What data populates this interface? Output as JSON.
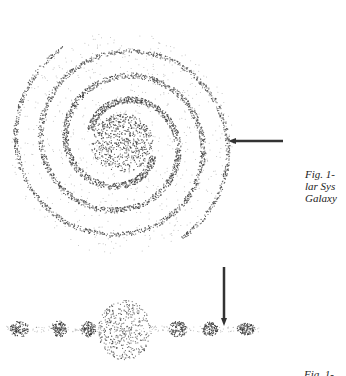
{
  "figure": {
    "top_view": {
      "name": "galaxy-top-view",
      "center": [
        122,
        143
      ],
      "arms": 2,
      "arrow": {
        "from": [
          283,
          141
        ],
        "to": [
          228,
          141
        ],
        "color": "#333333"
      }
    },
    "side_view": {
      "name": "galaxy-edge-on-view",
      "plane_y": 329,
      "bulge": {
        "cx": 125,
        "cy": 330,
        "rx": 27,
        "ry": 30
      },
      "clumps": [
        {
          "cx": 20,
          "rx": 10,
          "ry": 8
        },
        {
          "cx": 59,
          "rx": 8,
          "ry": 8
        },
        {
          "cx": 88,
          "rx": 8,
          "ry": 8
        },
        {
          "cx": 178,
          "rx": 9,
          "ry": 8
        },
        {
          "cx": 210,
          "rx": 8,
          "ry": 7
        },
        {
          "cx": 246,
          "rx": 9,
          "ry": 6
        }
      ],
      "arrow": {
        "from": [
          224,
          267
        ],
        "to": [
          224,
          326
        ],
        "color": "#333333"
      }
    },
    "dot_color": "#3a3a3a"
  },
  "captions": [
    {
      "lines": [
        "Fig. 1-",
        "lar Sys",
        "Galaxy"
      ]
    },
    {
      "lines": [
        "Fig. 1-"
      ]
    }
  ]
}
